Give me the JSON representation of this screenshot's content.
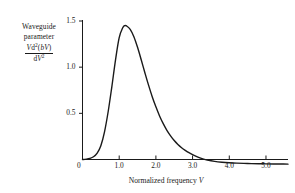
{
  "chart_data": {
    "type": "line",
    "title": "",
    "ylabel_lines": [
      "Waveguide",
      "parameter"
    ],
    "ylabel_fraction": {
      "numerator_parts": [
        {
          "text": "V",
          "italic": true
        },
        {
          "text": "d",
          "italic": false
        },
        {
          "text": "2",
          "sup": true
        },
        {
          "text": "(",
          "italic": false
        },
        {
          "text": "b",
          "italic": true
        },
        {
          "text": "V",
          "italic": true
        },
        {
          "text": ")",
          "italic": false
        }
      ],
      "denominator_parts": [
        {
          "text": "d",
          "italic": false
        },
        {
          "text": "V",
          "italic": true
        },
        {
          "text": "2",
          "sup": true
        }
      ],
      "numerator_plain": "Vd2(bV)",
      "denominator_plain": "dV2"
    },
    "xlabel": "Normalized frequency V",
    "xlabel_symbol": "V",
    "xlabel_text": "Normalized frequency",
    "xlim": [
      0,
      5.6
    ],
    "ylim": [
      -0.08,
      1.58
    ],
    "xticks": [
      1.0,
      2.0,
      3.0,
      4.0,
      5.0
    ],
    "xtick_labels": [
      "1.0",
      "2.0",
      "3.0",
      "4.0",
      "5.0"
    ],
    "yticks": [
      0.5,
      1.0,
      1.5
    ],
    "ytick_labels": [
      "0.5",
      "1.0",
      "1.5"
    ],
    "origin_label": "0",
    "grid": false,
    "legend": null,
    "line_color": "#1a1a1a",
    "line_width": 1.4,
    "peak": {
      "x": 1.15,
      "y": 1.45
    },
    "zero_crossing_x": 3.2,
    "x": [
      0.0,
      0.1,
      0.2,
      0.3,
      0.4,
      0.5,
      0.6,
      0.7,
      0.8,
      0.9,
      1.0,
      1.1,
      1.15,
      1.2,
      1.3,
      1.4,
      1.5,
      1.6,
      1.7,
      1.8,
      1.9,
      2.0,
      2.1,
      2.2,
      2.3,
      2.4,
      2.5,
      2.6,
      2.7,
      2.8,
      2.9,
      3.0,
      3.1,
      3.2,
      3.3,
      3.4,
      3.6,
      3.8,
      4.0,
      4.2,
      4.5,
      4.8,
      5.0,
      5.2,
      5.4,
      5.6
    ],
    "y": [
      0.0,
      0.004,
      0.012,
      0.03,
      0.07,
      0.15,
      0.3,
      0.52,
      0.79,
      1.08,
      1.32,
      1.43,
      1.45,
      1.447,
      1.41,
      1.33,
      1.215,
      1.08,
      0.94,
      0.805,
      0.68,
      0.57,
      0.472,
      0.388,
      0.316,
      0.256,
      0.205,
      0.163,
      0.128,
      0.099,
      0.074,
      0.053,
      0.034,
      0.018,
      0.004,
      -0.006,
      -0.02,
      -0.029,
      -0.035,
      -0.039,
      -0.043,
      -0.046,
      -0.047,
      -0.048,
      -0.049,
      -0.05
    ]
  },
  "axes": {
    "yaxis_name": "y-axis",
    "xaxis_name": "x-axis"
  }
}
